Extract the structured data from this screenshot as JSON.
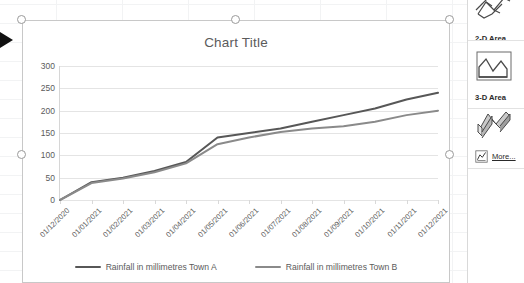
{
  "chart_object": {
    "title": "Chart Title",
    "selection_handles": 5
  },
  "legend": {
    "position": "bottom",
    "entries": [
      {
        "label": "Rainfall in millimetres Town A",
        "color": "#575757"
      },
      {
        "label": "Rainfall in millimetres Town B",
        "color": "#8a8a8a"
      }
    ]
  },
  "gallery_panel": {
    "groups": [
      {
        "label": "2-D Area",
        "icon": "area-chart-2d-icon"
      },
      {
        "label": "3-D Area",
        "icon": "area-chart-3d-icon"
      }
    ],
    "top_icon": "area-chart-3d-partial-icon",
    "more_link": "More...",
    "more_icon": "more-charts-icon"
  },
  "chart_data": {
    "type": "line",
    "title": "Chart Title",
    "xlabel": "",
    "ylabel": "",
    "grid": true,
    "legend_position": "bottom",
    "ylim": [
      0,
      300
    ],
    "yticks": [
      0,
      50,
      100,
      150,
      200,
      250,
      300
    ],
    "categories": [
      "01/12/2020",
      "01/01/2021",
      "01/02/2021",
      "01/03/2021",
      "01/04/2021",
      "01/05/2021",
      "01/06/2021",
      "01/07/2021",
      "01/08/2021",
      "01/09/2021",
      "01/10/2021",
      "01/11/2021",
      "01/12/2021"
    ],
    "series": [
      {
        "name": "Rainfall in millimetres Town A",
        "color": "#575757",
        "values": [
          0,
          40,
          50,
          65,
          85,
          140,
          150,
          160,
          175,
          190,
          205,
          225,
          240
        ]
      },
      {
        "name": "Rainfall in millimetres Town B",
        "color": "#8a8a8a",
        "values": [
          0,
          38,
          48,
          62,
          82,
          125,
          140,
          152,
          160,
          165,
          175,
          190,
          200
        ]
      }
    ]
  }
}
